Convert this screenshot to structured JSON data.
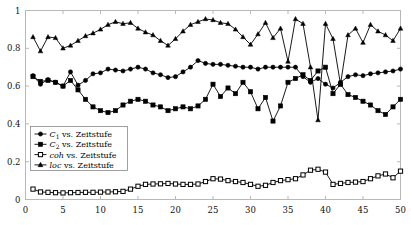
{
  "chart_data": {
    "type": "line",
    "title": "",
    "xlabel": "",
    "ylabel": "",
    "xlim": [
      0,
      50
    ],
    "ylim": [
      0,
      1
    ],
    "grid": false,
    "legend_position": "center-left",
    "xticks": [
      0,
      5,
      10,
      15,
      20,
      25,
      30,
      35,
      40,
      45,
      50
    ],
    "yticks": [
      0,
      0.2,
      0.4,
      0.6,
      0.8,
      1
    ],
    "xtick_labels": [
      "0",
      "5",
      "10",
      "15",
      "20",
      "25",
      "30",
      "35",
      "40",
      "45",
      "50"
    ],
    "ytick_labels": [
      "0",
      "0.2",
      "0.4",
      "0.6",
      "0.8",
      "1"
    ],
    "x": [
      1,
      2,
      3,
      4,
      5,
      6,
      7,
      8,
      9,
      10,
      11,
      12,
      13,
      14,
      15,
      16,
      17,
      18,
      19,
      20,
      21,
      22,
      23,
      24,
      25,
      26,
      27,
      28,
      29,
      30,
      31,
      32,
      33,
      34,
      35,
      36,
      37,
      38,
      39,
      40,
      41,
      42,
      43,
      44,
      45,
      46,
      47,
      48,
      49,
      50
    ],
    "series": [
      {
        "name": "C_1",
        "legend": "C₁ vs. Zeitstufe",
        "label_main": "C",
        "label_sub": "1",
        "label_rest": " vs. Zeitstufe",
        "marker": "circle",
        "color": "#000000",
        "values": [
          0.655,
          0.61,
          0.635,
          0.62,
          0.6,
          0.675,
          0.605,
          0.63,
          0.665,
          0.67,
          0.69,
          0.685,
          0.68,
          0.69,
          0.7,
          0.69,
          0.67,
          0.66,
          0.645,
          0.65,
          0.675,
          0.7,
          0.735,
          0.72,
          0.715,
          0.715,
          0.71,
          0.705,
          0.7,
          0.7,
          0.69,
          0.7,
          0.7,
          0.7,
          0.7,
          0.7,
          0.65,
          0.62,
          0.64,
          0.61,
          0.59,
          0.62,
          0.65,
          0.66,
          0.655,
          0.665,
          0.67,
          0.675,
          0.68,
          0.69
        ]
      },
      {
        "name": "C_2",
        "legend": "C₂ vs. Zeitstufe",
        "label_main": "C",
        "label_sub": "2",
        "label_rest": " vs. Zeitstufe",
        "marker": "square",
        "color": "#000000",
        "values": [
          0.65,
          0.625,
          0.63,
          0.62,
          0.6,
          0.63,
          0.58,
          0.53,
          0.49,
          0.47,
          0.46,
          0.47,
          0.5,
          0.52,
          0.53,
          0.52,
          0.5,
          0.49,
          0.47,
          0.48,
          0.49,
          0.48,
          0.495,
          0.53,
          0.61,
          0.545,
          0.59,
          0.56,
          0.62,
          0.57,
          0.48,
          0.54,
          0.415,
          0.495,
          0.62,
          0.64,
          0.66,
          0.63,
          0.68,
          0.7,
          0.56,
          0.61,
          0.555,
          0.54,
          0.52,
          0.5,
          0.47,
          0.45,
          0.49,
          0.53
        ]
      },
      {
        "name": "coh",
        "legend": "coh vs. Zeitstufe",
        "label_main": "coh",
        "label_sub": "",
        "label_rest": " vs. Zeitstufe",
        "marker": "open-square",
        "color": "#000000",
        "values": [
          0.055,
          0.04,
          0.038,
          0.036,
          0.035,
          0.036,
          0.037,
          0.038,
          0.038,
          0.039,
          0.04,
          0.041,
          0.043,
          0.055,
          0.07,
          0.08,
          0.082,
          0.083,
          0.085,
          0.082,
          0.08,
          0.08,
          0.082,
          0.095,
          0.11,
          0.108,
          0.1,
          0.095,
          0.09,
          0.08,
          0.07,
          0.075,
          0.09,
          0.1,
          0.105,
          0.11,
          0.13,
          0.155,
          0.16,
          0.145,
          0.08,
          0.085,
          0.09,
          0.092,
          0.095,
          0.11,
          0.125,
          0.135,
          0.115,
          0.15
        ]
      },
      {
        "name": "loc",
        "legend": "loc vs. Zeitstufe",
        "label_main": "loc",
        "label_sub": "",
        "label_rest": " vs. Zeitstufe",
        "marker": "triangle",
        "color": "#000000",
        "values": [
          0.86,
          0.785,
          0.86,
          0.855,
          0.8,
          0.815,
          0.84,
          0.865,
          0.88,
          0.9,
          0.925,
          0.94,
          0.93,
          0.935,
          0.905,
          0.885,
          0.87,
          0.84,
          0.815,
          0.85,
          0.89,
          0.925,
          0.94,
          0.955,
          0.95,
          0.935,
          0.93,
          0.9,
          0.86,
          0.82,
          0.875,
          0.935,
          0.855,
          0.905,
          0.73,
          0.955,
          0.93,
          0.7,
          0.42,
          0.93,
          0.85,
          0.61,
          0.87,
          0.905,
          0.83,
          0.925,
          0.89,
          0.87,
          0.84,
          0.905
        ]
      }
    ]
  },
  "legend": {
    "entries": [
      {
        "label_main": "C",
        "label_sub": "1",
        "label_rest": " vs. Zeitstufe",
        "marker": "circle"
      },
      {
        "label_main": "C",
        "label_sub": "2",
        "label_rest": " vs. Zeitstufe",
        "marker": "square"
      },
      {
        "label_main": "coh",
        "label_sub": "",
        "label_rest": " vs. Zeitstufe",
        "marker": "open-square"
      },
      {
        "label_main": "loc",
        "label_sub": "",
        "label_rest": " vs. Zeitstufe",
        "marker": "triangle"
      }
    ]
  },
  "colors": {
    "axis": "#b8b8b8",
    "data": "#000000",
    "background": "#ffffff"
  }
}
